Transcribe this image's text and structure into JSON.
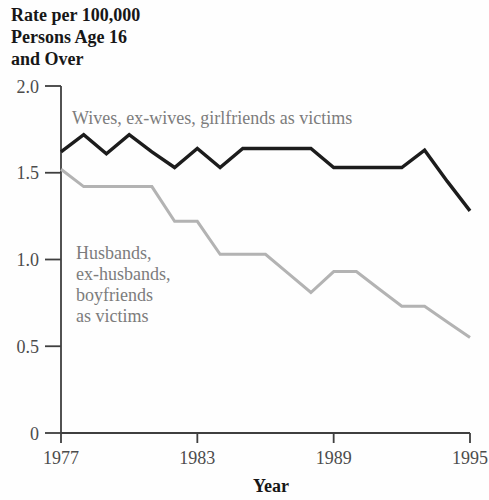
{
  "chart_data": {
    "type": "line",
    "x": [
      1977,
      1978,
      1979,
      1980,
      1981,
      1982,
      1983,
      1984,
      1985,
      1986,
      1987,
      1988,
      1989,
      1990,
      1991,
      1992,
      1993,
      1994,
      1995
    ],
    "series": [
      {
        "name": "Wives, ex-wives, girlfriends as victims",
        "color": "#1c1c1c",
        "values": [
          1.62,
          1.72,
          1.61,
          1.72,
          1.62,
          1.53,
          1.64,
          1.53,
          1.64,
          1.64,
          1.64,
          1.64,
          1.53,
          1.53,
          1.53,
          1.53,
          1.63,
          1.45,
          1.28
        ]
      },
      {
        "name": "Husbands, ex-husbands, boyfriends as victims",
        "color": "#b3b3b3",
        "values": [
          1.52,
          1.42,
          1.42,
          1.42,
          1.42,
          1.22,
          1.22,
          1.03,
          1.03,
          1.03,
          0.92,
          0.81,
          0.93,
          0.93,
          0.83,
          0.73,
          0.73,
          0.64,
          0.55
        ]
      }
    ],
    "ylabel_lines": [
      "Rate per 100,000",
      "Persons Age 16",
      "and Over"
    ],
    "ylabel": "Rate per 100,000 Persons Age 16 and Over",
    "xlabel": "Year",
    "xlim": [
      1977,
      1995
    ],
    "ylim": [
      0,
      2.0
    ],
    "y_ticks": [
      "2.0",
      "1.5",
      "1.0",
      "0.5",
      "0"
    ],
    "x_ticks": [
      "1977",
      "1983",
      "1989",
      "1995"
    ],
    "grid": false,
    "legend_position": "inline-annotations",
    "annotations": [
      {
        "series": 0,
        "lines": [
          "Wives, ex-wives, girlfriends as victims"
        ]
      },
      {
        "series": 1,
        "lines": [
          "Husbands,",
          "ex-husbands,",
          "boyfriends",
          "as victims"
        ]
      }
    ]
  },
  "colors": {
    "background": "#fefefe",
    "axis": "#3f3f3f",
    "tick_label": "#4c4c4c",
    "annotation_text": "#7c7c7c",
    "title_text": "#171717",
    "wives_line": "#1c1c1c",
    "husbands_line": "#b3b3b3"
  }
}
